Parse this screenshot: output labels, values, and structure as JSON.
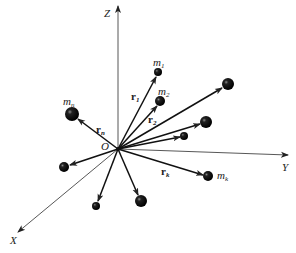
{
  "diagram": {
    "type": "system of particles with position vectors",
    "origin": {
      "label": "O",
      "x": 118,
      "y": 149
    },
    "axes": [
      {
        "name": "Z",
        "label": "Z",
        "from": [
          118,
          149
        ],
        "to": [
          118,
          5
        ]
      },
      {
        "name": "Y",
        "label": "Y",
        "from": [
          118,
          149
        ],
        "to": [
          288,
          155
        ]
      },
      {
        "name": "X",
        "label": "X",
        "from": [
          118,
          149
        ],
        "to": [
          18,
          232
        ]
      }
    ],
    "masses": [
      {
        "id": "m1",
        "label": "m",
        "sub": "1",
        "x": 158,
        "y": 72,
        "r": 4,
        "vector_label": "r",
        "vector_sub": "1"
      },
      {
        "id": "m2",
        "label": "m",
        "sub": "2",
        "x": 160,
        "y": 101,
        "r": 5,
        "vector_label": "r",
        "vector_sub": "2"
      },
      {
        "id": "p3",
        "x": 228,
        "y": 84,
        "r": 6
      },
      {
        "id": "p4",
        "x": 206,
        "y": 122,
        "r": 6
      },
      {
        "id": "p5",
        "x": 184,
        "y": 136,
        "r": 4
      },
      {
        "id": "mk",
        "label": "m",
        "sub": "k",
        "x": 208,
        "y": 176,
        "r": 5,
        "vector_label": "r",
        "vector_sub": "k"
      },
      {
        "id": "mn",
        "label": "m",
        "sub": "n",
        "x": 72,
        "y": 114,
        "r": 7,
        "vector_label": "r",
        "vector_sub": "n"
      },
      {
        "id": "p8",
        "x": 64,
        "y": 167,
        "r": 5
      },
      {
        "id": "p9",
        "x": 96,
        "y": 206,
        "r": 4
      },
      {
        "id": "p10",
        "x": 141,
        "y": 201,
        "r": 6
      }
    ]
  },
  "labels": {
    "z_axis": "Z",
    "y_axis": "Y",
    "x_axis": "X",
    "origin": "O",
    "m1": {
      "base": "m",
      "sub": "1"
    },
    "m2": {
      "base": "m",
      "sub": "2"
    },
    "mk": {
      "base": "m",
      "sub": "k"
    },
    "mn": {
      "base": "m",
      "sub": "n"
    },
    "r1": {
      "base": "r",
      "sub": "1"
    },
    "r2": {
      "base": "r",
      "sub": "2"
    },
    "rk": {
      "base": "r",
      "sub": "k"
    },
    "rn": {
      "base": "r",
      "sub": "n"
    }
  }
}
